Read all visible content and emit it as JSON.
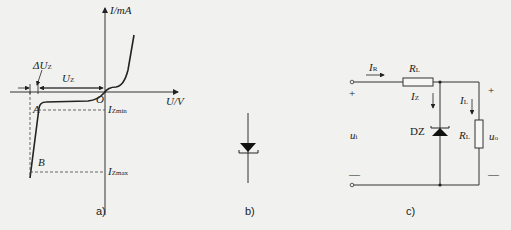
{
  "figure_a": {
    "y_axis_label": "I/mA",
    "x_axis_label": "U/V",
    "origin_label": "O",
    "delta_uz_label": "ΔU",
    "delta_uz_sub": "Z",
    "uz_label": "U",
    "uz_sub": "Z",
    "point_a": "A",
    "point_b": "B",
    "izmin_label": "I",
    "izmin_sub": "Zmin",
    "izmax_label": "I",
    "izmax_sub": "Zmax",
    "caption": "a)"
  },
  "figure_b": {
    "symbol": "zener-diode",
    "caption": "b)"
  },
  "figure_c": {
    "input_current": "I",
    "input_current_sub": "R",
    "series_resistor": "R",
    "series_resistor_sub": "L",
    "zener_current": "I",
    "zener_current_sub": "Z",
    "zener_label": "DZ",
    "load_current": "I",
    "load_current_sub": "L",
    "load_resistor": "R",
    "load_resistor_sub": "L",
    "input_voltage": "u",
    "input_voltage_sub": "i",
    "output_voltage": "u",
    "output_voltage_sub": "o",
    "plus_left": "+",
    "minus_left": "—",
    "plus_right": "+",
    "minus_right": "—",
    "caption": "c)"
  }
}
